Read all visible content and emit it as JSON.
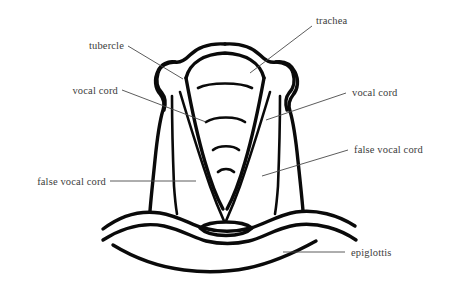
{
  "figure": {
    "background_color": "#ffffff",
    "line_color": "#0a0a0a",
    "label_color": "#3c3c3c",
    "leader_color": "#4a4a4a",
    "labels": {
      "tubercle": "tubercle",
      "trachea": "trachea",
      "vocal_cord_left": "vocal cord",
      "vocal_cord_right": "vocal cord",
      "false_vocal_cord_left": "false vocal cord",
      "false_vocal_cord_right": "false vocal cord",
      "epiglottis": "epiglottis"
    },
    "parts": [
      "outer laryngeal wall",
      "left tubercle",
      "right tubercle",
      "trachea opening",
      "tracheal cartilage rings",
      "left vocal cord",
      "right vocal cord",
      "left false vocal cord",
      "right false vocal cord",
      "glottis",
      "epiglottis"
    ],
    "tracheal_ring_count": 4
  }
}
